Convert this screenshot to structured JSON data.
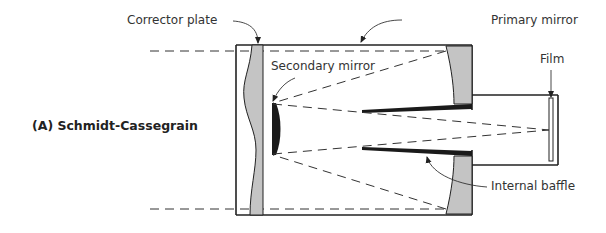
{
  "diagram": {
    "title": "(A) Schmidt-Cassegrain",
    "labels": {
      "corrector_plate": "Corrector plate",
      "primary_mirror": "Primary mirror",
      "secondary_mirror": "Secondary mirror",
      "film": "Film",
      "internal_baffle": "Internal baffle"
    },
    "colors": {
      "outline": "#222222",
      "glass_fill": "#c4c4c4",
      "baffle_fill": "#1a1a1a",
      "ray": "#333333"
    }
  }
}
